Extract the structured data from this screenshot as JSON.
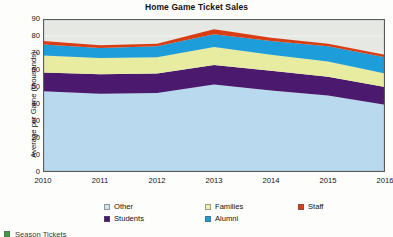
{
  "chart_data": {
    "type": "area",
    "title": "Home Game Ticket Sales",
    "xlabel": "",
    "ylabel": "Average per Game (thousands)",
    "x": [
      2010,
      2011,
      2012,
      2013,
      2014,
      2015,
      2016
    ],
    "categories": [
      "2010",
      "2011",
      "2012",
      "2013",
      "2014",
      "2015",
      "2016"
    ],
    "xlim": [
      2010,
      2016
    ],
    "ylim": [
      0,
      90
    ],
    "yticks": [
      0,
      10,
      20,
      30,
      40,
      50,
      60,
      70,
      80,
      90
    ],
    "grid": true,
    "stacked": true,
    "legend_position": "bottom",
    "stack_order_bottom_to_top": [
      "Other",
      "Students",
      "Families",
      "Alumni",
      "Staff"
    ],
    "series": [
      {
        "name": "Other",
        "color": "#b9d9ee",
        "values": [
          47.5,
          46.0,
          46.5,
          51.5,
          48.0,
          45.0,
          39.5
        ]
      },
      {
        "name": "Students",
        "color": "#4b1a6f",
        "values": [
          11.0,
          11.5,
          11.5,
          11.5,
          11.5,
          11.0,
          10.5
        ]
      },
      {
        "name": "Families",
        "color": "#e8eca0",
        "values": [
          10.0,
          9.5,
          9.5,
          10.5,
          9.5,
          9.0,
          8.0
        ]
      },
      {
        "name": "Alumni",
        "color": "#1d9dd9",
        "values": [
          6.5,
          6.0,
          6.5,
          7.5,
          8.0,
          9.0,
          9.5
        ]
      },
      {
        "name": "Staff",
        "color": "#d93d14",
        "values": [
          2.0,
          1.5,
          1.5,
          3.0,
          2.0,
          1.5,
          1.5
        ]
      }
    ],
    "cumulative_tops": {
      "Other": [
        47.5,
        46.0,
        46.5,
        51.5,
        48.0,
        45.0,
        39.5
      ],
      "Students": [
        58.5,
        57.5,
        58.0,
        63.0,
        59.5,
        56.0,
        50.0
      ],
      "Families": [
        68.5,
        67.0,
        67.5,
        73.5,
        69.0,
        65.0,
        58.0
      ],
      "Alumni": [
        75.0,
        73.0,
        74.0,
        81.0,
        77.0,
        74.0,
        67.5
      ],
      "Staff": [
        77.0,
        74.5,
        75.5,
        84.0,
        79.0,
        75.5,
        69.0
      ]
    },
    "plot_background": "#e6e8e3",
    "plot_border": "#5a5a5a"
  },
  "legend": {
    "items": [
      {
        "label": "Other",
        "color": "#cfe3f2",
        "name": "other"
      },
      {
        "label": "Families",
        "color": "#efefb4",
        "name": "families"
      },
      {
        "label": "Staff",
        "color": "#d93d14",
        "name": "staff"
      },
      {
        "label": "Students",
        "color": "#4b1a6f",
        "name": "students"
      },
      {
        "label": "Alumni",
        "color": "#1d9dd9",
        "name": "alumni"
      }
    ]
  },
  "cut_off_row": {
    "label": "Season Tickets",
    "color": "#3f9a48"
  }
}
